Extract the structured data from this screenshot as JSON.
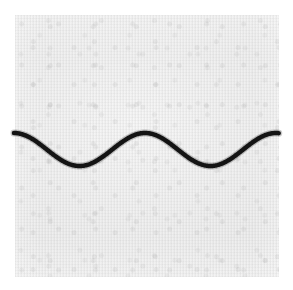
{
  "figure": {
    "background_color": "#ffffff",
    "panel_color": "#e9e9e9",
    "curve_color": "#141414",
    "caption": ""
  },
  "panel": {
    "x": 15,
    "y": 15,
    "width": 264,
    "height": 262
  },
  "chart_data": {
    "type": "line",
    "title": "",
    "subtitle": "",
    "xlabel": "",
    "ylabel": "",
    "grid": false,
    "legend": null,
    "axis_visible": false,
    "tick_labels_x": [],
    "tick_labels_y": [],
    "xlim": [
      14,
      279
    ],
    "ylim": [
      133,
      166
    ],
    "waveform": {
      "shape": "sine",
      "amplitude_px": 16.5,
      "period_px": 131,
      "midline_y_px": 149.5,
      "phase": "starts at crest at left edge",
      "cycles_visible": 2,
      "stroke_width_px": 4.5,
      "stroke_color": "#141414",
      "start_point": [
        14,
        133
      ],
      "end_point": [
        279,
        133
      ]
    },
    "series": [
      {
        "name": "sine",
        "x": [
          14,
          22,
          30,
          38,
          47,
          55,
          63,
          71,
          80,
          88,
          96,
          104,
          113,
          121,
          129,
          137,
          146,
          154,
          162,
          170,
          179,
          187,
          195,
          203,
          212,
          220,
          228,
          236,
          245,
          253,
          261,
          269,
          279
        ],
        "values": [
          133.0,
          133.6,
          135.3,
          138.0,
          141.6,
          145.4,
          149.5,
          153.6,
          157.4,
          161.0,
          163.7,
          165.4,
          166.0,
          165.4,
          163.7,
          161.0,
          157.4,
          153.6,
          149.5,
          145.4,
          141.6,
          138.0,
          135.3,
          133.6,
          133.0,
          133.6,
          135.3,
          138.0,
          141.6,
          145.4,
          149.5,
          153.6,
          133.0
        ]
      }
    ],
    "extrema": [
      {
        "kind": "crest",
        "x": 14,
        "y": 133
      },
      {
        "kind": "trough",
        "x": 82,
        "y": 166
      },
      {
        "kind": "crest",
        "x": 147,
        "y": 133
      },
      {
        "kind": "trough",
        "x": 213,
        "y": 166
      },
      {
        "kind": "crest",
        "x": 279,
        "y": 133
      }
    ]
  }
}
